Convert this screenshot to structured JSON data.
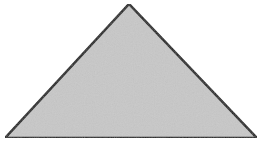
{
  "diagram": {
    "shape": "triangle",
    "type": "isosceles-obtuse",
    "vertices": {
      "apex": [
        129,
        4
      ],
      "bottom_left": [
        5,
        138
      ],
      "bottom_right": [
        257,
        138
      ]
    },
    "fill_color": "#c8c8c8",
    "stroke_color": "#1a1a1a",
    "stroke_width": 2.5
  }
}
